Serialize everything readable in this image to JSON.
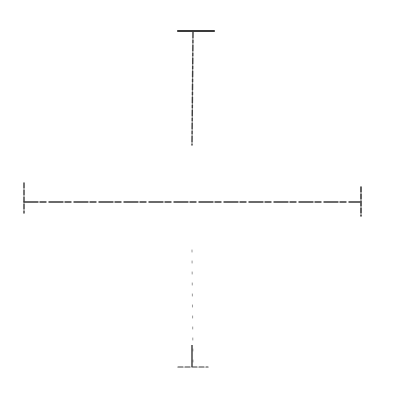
{
  "sketch": {
    "description": "Hand-drawn pencil crosshair with end caps",
    "stroke_color": "#3a3a3a",
    "faint_color": "#9a9a9a",
    "background": "#ffffff",
    "elements": {
      "top_cap": {
        "x1": 178,
        "y1": 31,
        "x2": 214,
        "y2": 31
      },
      "vertical_upper": {
        "x1": 193,
        "y1": 32,
        "x2": 192,
        "y2": 145
      },
      "vertical_lower": {
        "x1": 192,
        "y1": 250,
        "x2": 193,
        "y2": 366
      },
      "bottom_cap": {
        "x1": 178,
        "y1": 367,
        "x2": 208,
        "y2": 367
      },
      "horizontal": {
        "x1": 24,
        "y1": 202,
        "x2": 360,
        "y2": 202
      },
      "left_tick": {
        "x1": 24,
        "y1": 183,
        "x2": 24,
        "y2": 213
      },
      "right_tick": {
        "x1": 361,
        "y1": 187,
        "x2": 361,
        "y2": 216
      }
    }
  }
}
